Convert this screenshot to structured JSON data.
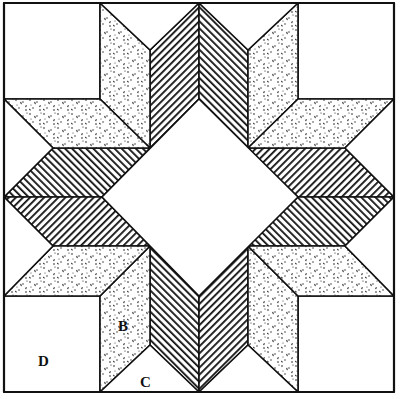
{
  "diagram": {
    "type": "quilt-block",
    "colors": {
      "line": "#111111",
      "background": "#ffffff",
      "print_dot": "#1a1a1a"
    },
    "fabrics": [
      {
        "id": "print",
        "name": "speckled print",
        "pattern": "speckle"
      },
      {
        "id": "stripe_a",
        "name": "stripe (diagonal \\)",
        "pattern": "stripe"
      },
      {
        "id": "stripe_b",
        "name": "stripe (diagonal /)",
        "pattern": "stripe"
      },
      {
        "id": "plain",
        "name": "plain white",
        "pattern": "none"
      }
    ],
    "labels": [
      {
        "text": "B",
        "x": 126,
        "y": 326,
        "refers_to": "diamond piece"
      },
      {
        "text": "C",
        "x": 148,
        "y": 382,
        "refers_to": "setting triangle"
      },
      {
        "text": "D",
        "x": 46,
        "y": 361,
        "refers_to": "corner square"
      }
    ]
  }
}
